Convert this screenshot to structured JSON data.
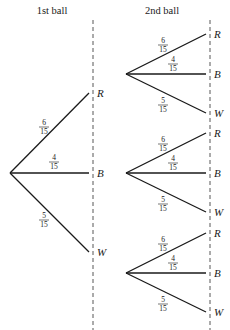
{
  "headers": {
    "stage1": "1st ball",
    "stage2": "2nd ball"
  },
  "labels": {
    "R": "R",
    "B": "B",
    "W": "W"
  },
  "probabilities": {
    "R": {
      "num": "6",
      "den": "15"
    },
    "B": {
      "num": "4",
      "den": "15"
    },
    "W": {
      "num": "5",
      "den": "15"
    }
  },
  "tree": {
    "stage1": [
      {
        "outcome": "R",
        "p": "6/15"
      },
      {
        "outcome": "B",
        "p": "4/15"
      },
      {
        "outcome": "W",
        "p": "5/15"
      }
    ],
    "stage2": [
      {
        "after": "R",
        "branches": [
          {
            "outcome": "R",
            "p": "6/15"
          },
          {
            "outcome": "B",
            "p": "4/15"
          },
          {
            "outcome": "W",
            "p": "5/15"
          }
        ]
      },
      {
        "after": "B",
        "branches": [
          {
            "outcome": "R",
            "p": "6/15"
          },
          {
            "outcome": "B",
            "p": "4/15"
          },
          {
            "outcome": "W",
            "p": "5/15"
          }
        ]
      },
      {
        "after": "W",
        "branches": [
          {
            "outcome": "R",
            "p": "6/15"
          },
          {
            "outcome": "B",
            "p": "4/15"
          },
          {
            "outcome": "W",
            "p": "5/15"
          }
        ]
      }
    ]
  }
}
